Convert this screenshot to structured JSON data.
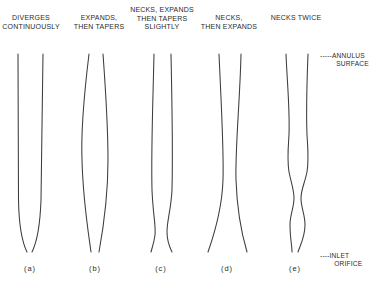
{
  "figure": {
    "profiles": [
      {
        "id": "a",
        "caption": "DIVERGES\nCONTINUOUSLY",
        "label": "(a)"
      },
      {
        "id": "b",
        "caption": "EXPANDS,\nTHEN TAPERS",
        "label": "(b)"
      },
      {
        "id": "c",
        "caption": "NECKS, EXPANDS\nTHEN TAPERS\nSLIGHTLY",
        "label": "(c)"
      },
      {
        "id": "d",
        "caption": "NECKS,\nTHEN EXPANDS",
        "label": "(d)"
      },
      {
        "id": "e",
        "caption": "NECKS TWICE",
        "label": "(e)"
      }
    ],
    "annotations": {
      "top": "-----ANNULUS\n        SURFACE",
      "bottom": "----INLET\n       ORIFICE"
    },
    "line_color": "#3c3c3c"
  }
}
